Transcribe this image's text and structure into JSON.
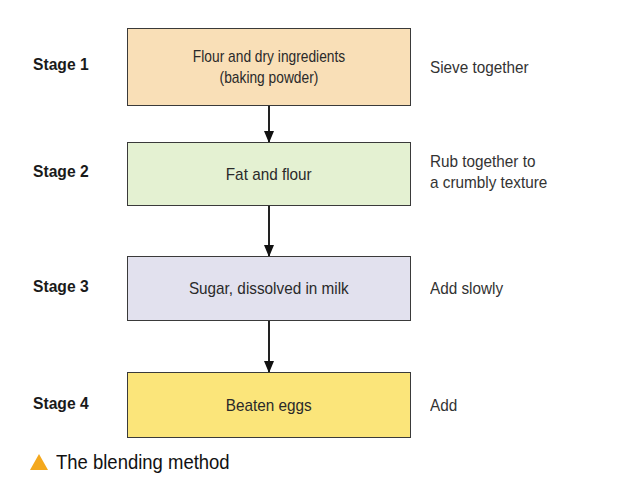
{
  "stages": [
    {
      "label": "Stage 1",
      "box_line1": "Flour and dry ingredients",
      "box_line2": "(baking powder)",
      "note_line1": "Sieve together",
      "note_line2": "",
      "color": "#f9dfb7"
    },
    {
      "label": "Stage 2",
      "box_line1": "Fat and flour",
      "box_line2": "",
      "note_line1": "Rub together to",
      "note_line2": "a crumbly texture",
      "color": "#e4f1d2"
    },
    {
      "label": "Stage 3",
      "box_line1": "Sugar, dissolved in milk",
      "box_line2": "",
      "note_line1": "Add slowly",
      "note_line2": "",
      "color": "#e2e1ee"
    },
    {
      "label": "Stage 4",
      "box_line1": "Beaten eggs",
      "box_line2": "",
      "note_line1": "Add",
      "note_line2": "",
      "color": "#fbe57a"
    }
  ],
  "caption": {
    "icon": "triangle-icon",
    "text": "The blending method",
    "icon_color": "#f4a81d"
  }
}
